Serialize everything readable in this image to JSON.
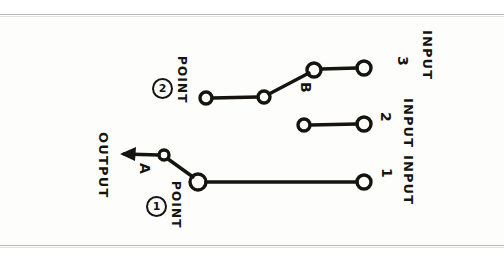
{
  "figure": {
    "kind": "hand-drawn-schematic",
    "ink_color": "#16140f",
    "paper_color": "#fdfdfb",
    "scan_rule_color": "#b9b9b7"
  },
  "labels": {
    "input_word": "INPUT",
    "output_word": "OUTPUT",
    "point_word": "POINT",
    "input_3_number": "3",
    "input_2_number": "2",
    "input_1_number": "1",
    "point_2_number": "2",
    "point_1_number": "1",
    "contact_a": "A",
    "contact_b": "B"
  },
  "terminals": [
    {
      "name": "point-2-terminal",
      "cx": 206,
      "cy": 98,
      "r": 6
    },
    {
      "name": "pivot-2-terminal",
      "cx": 264,
      "cy": 97,
      "r": 6
    },
    {
      "name": "contact-b-terminal",
      "cx": 314,
      "cy": 70,
      "r": 7
    },
    {
      "name": "input-3-terminal",
      "cx": 364,
      "cy": 68,
      "r": 7
    },
    {
      "name": "input-2-left-terminal",
      "cx": 304,
      "cy": 125,
      "r": 6
    },
    {
      "name": "input-2-terminal",
      "cx": 364,
      "cy": 124,
      "r": 7
    },
    {
      "name": "contact-a-terminal",
      "cx": 164,
      "cy": 155,
      "r": 5
    },
    {
      "name": "point-1-terminal",
      "cx": 198,
      "cy": 182,
      "r": 8
    },
    {
      "name": "input-1-terminal",
      "cx": 364,
      "cy": 182,
      "r": 7
    }
  ],
  "wires": [
    {
      "name": "point-2-to-pivot",
      "d": "M 212 98 L 258 97"
    },
    {
      "name": "pivot-2-to-contact-b",
      "d": "M 269 94 L 309 73"
    },
    {
      "name": "contact-b-to-input-3",
      "d": "M 321 69 L 357 68"
    },
    {
      "name": "input-2-segment",
      "d": "M 310 125 L 357 124"
    },
    {
      "name": "contact-a-to-point-1",
      "d": "M 168 159 L 193 177"
    },
    {
      "name": "point-1-to-input-1",
      "d": "M 206 182 L 357 182"
    },
    {
      "name": "output-arrow-shaft",
      "d": "M 159 155 L 123 154"
    }
  ],
  "arrow": {
    "name": "output-arrow",
    "points": "123,154 135,148 134,160",
    "direction": "left"
  }
}
